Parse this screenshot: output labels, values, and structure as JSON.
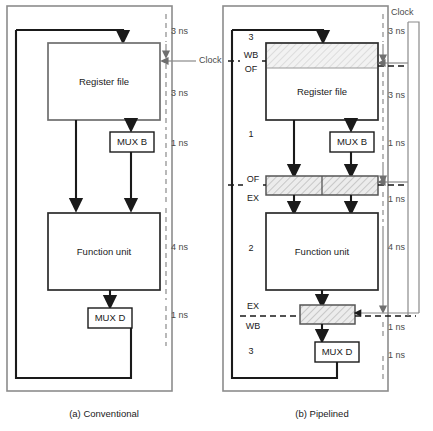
{
  "figure": {
    "panels": [
      {
        "id": "conventional",
        "caption": "(a) Conventional",
        "blocks": {
          "register_file": "Register file",
          "function_unit": "Function unit",
          "mux_b": "MUX B",
          "mux_d": "MUX D"
        },
        "clock_label": "Clock",
        "timings": [
          {
            "label": "3 ns",
            "segment": "input-to-register-file"
          },
          {
            "label": "3 ns",
            "segment": "register-file-read"
          },
          {
            "label": "1 ns",
            "segment": "mux-b"
          },
          {
            "label": "4 ns",
            "segment": "function-unit"
          },
          {
            "label": "1 ns",
            "segment": "mux-d"
          }
        ]
      },
      {
        "id": "pipelined",
        "caption": "(b) Pipelined",
        "blocks": {
          "register_file": "Register file",
          "function_unit": "Function unit",
          "mux_b": "MUX B",
          "mux_d": "MUX D"
        },
        "clock_label": "Clock",
        "stage_numbers": [
          "3",
          "1",
          "2",
          "3"
        ],
        "stage_boundaries": [
          {
            "above": "WB",
            "below": "OF"
          },
          {
            "above": "OF",
            "below": "EX"
          },
          {
            "above": "EX",
            "below": "WB"
          }
        ],
        "timings": [
          {
            "label": "3 ns",
            "segment": "input-to-register-file"
          },
          {
            "label": "3 ns",
            "segment": "register-file-read"
          },
          {
            "label": "1 ns",
            "segment": "mux-b"
          },
          {
            "label": "1 ns",
            "segment": "of-ex-latch"
          },
          {
            "label": "4 ns",
            "segment": "function-unit"
          },
          {
            "label": "1 ns",
            "segment": "ex-wb-latch"
          },
          {
            "label": "1 ns",
            "segment": "mux-d"
          }
        ]
      }
    ]
  },
  "colors": {
    "frame": "#8c8c8c",
    "wire": "#1a1a1a",
    "ruler": "#8a8a8a",
    "latch_fill": "#e8e8e8",
    "text": "#1a1a1a"
  }
}
